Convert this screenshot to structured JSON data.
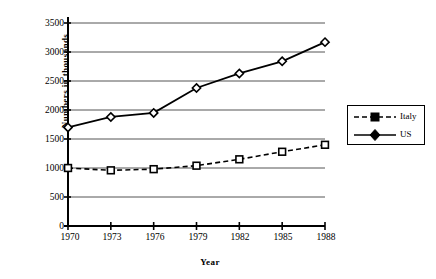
{
  "chart_data": {
    "type": "line",
    "title": "",
    "xlabel": "Year",
    "ylabel": "Numbers in thousands",
    "categories": [
      "1970",
      "1973",
      "1976",
      "1979",
      "1982",
      "1985",
      "1988"
    ],
    "series": [
      {
        "name": "Italy",
        "values": [
          1000,
          960,
          980,
          1040,
          1150,
          1280,
          1400
        ],
        "line_style": "dashed",
        "marker": "square",
        "color": "#000000"
      },
      {
        "name": "US",
        "values": [
          1700,
          1880,
          1950,
          2380,
          2630,
          2840,
          3170
        ],
        "line_style": "solid",
        "marker": "diamond",
        "color": "#000000"
      }
    ],
    "ylim": [
      0,
      3500
    ],
    "ytick_labels": [
      "0",
      "500",
      "1000",
      "1500",
      "2000",
      "2500",
      "3000",
      "3500"
    ],
    "ytick_values": [
      0,
      500,
      1000,
      1500,
      2000,
      2500,
      3000,
      3500
    ],
    "grid": "horizontal",
    "legend_position": "right",
    "legend_entries": [
      "Italy",
      "US"
    ],
    "axis_color": "#000000",
    "grid_color": "#555555",
    "background": "#ffffff"
  }
}
